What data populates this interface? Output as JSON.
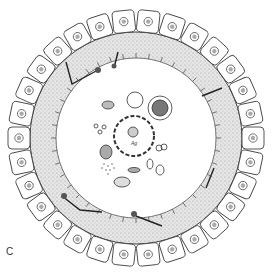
{
  "figure": {
    "panel_label": "C",
    "center_label": "Ag",
    "colors": {
      "line": "#333333",
      "stroma_fill": "#d8d8d8",
      "cell_fill": "#ffffff",
      "background": "#ffffff"
    }
  }
}
